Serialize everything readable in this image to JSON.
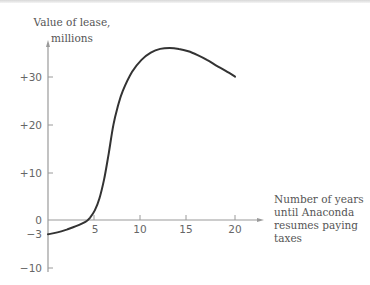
{
  "chart_data": {
    "type": "line",
    "title": "",
    "ylabel": "Value of lease, millions",
    "ylabel_lines": [
      "Value of lease,",
      "millions"
    ],
    "xlabel": "Number of years until Anaconda resumes paying taxes",
    "xlabel_lines": [
      "Number of years",
      "until Anaconda",
      "resumes paying",
      "taxes"
    ],
    "x_ticks": [
      5,
      10,
      15,
      20
    ],
    "x_tick_labels": [
      "5",
      "10",
      "15",
      "20"
    ],
    "y_ticks": [
      30,
      20,
      10,
      0,
      -3,
      -10
    ],
    "y_tick_labels": [
      "+30",
      "+20",
      "+10",
      "0",
      "−3",
      "−10"
    ],
    "xlim": [
      0,
      21
    ],
    "ylim": [
      -10,
      38
    ],
    "grid": false,
    "legend": null,
    "series": [
      {
        "name": "Value of lease",
        "x": [
          0,
          1,
          2,
          3,
          4,
          4.5,
          5,
          5.5,
          6,
          6.5,
          7,
          7.5,
          8,
          9,
          10,
          11,
          12,
          13,
          14,
          15,
          16,
          17,
          18,
          19,
          20
        ],
        "values": [
          -3,
          -2.6,
          -2,
          -1.3,
          -0.4,
          0.5,
          2,
          4.5,
          8.5,
          14,
          20,
          24,
          27,
          31,
          33.5,
          35,
          35.8,
          36,
          35.8,
          35.3,
          34.5,
          33.5,
          32.3,
          31.2,
          30
        ]
      }
    ],
    "axis_color": "#9a9a9a",
    "line_color": "#333333"
  }
}
